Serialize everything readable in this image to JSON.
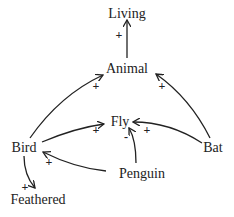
{
  "nodes": {
    "living": "Living",
    "animal": "Animal",
    "fly": "Fly",
    "bird": "Bird",
    "bat": "Bat",
    "penguin": "Penguin",
    "feathered": "Feathered"
  },
  "edges": [
    {
      "from": "Animal",
      "to": "Living",
      "sign": "+"
    },
    {
      "from": "Bird",
      "to": "Animal",
      "sign": "+"
    },
    {
      "from": "Bat",
      "to": "Animal",
      "sign": "+"
    },
    {
      "from": "Bird",
      "to": "Fly",
      "sign": "+"
    },
    {
      "from": "Bat",
      "to": "Fly",
      "sign": "+"
    },
    {
      "from": "Penguin",
      "to": "Fly",
      "sign": "-"
    },
    {
      "from": "Penguin",
      "to": "Bird",
      "sign": "+"
    },
    {
      "from": "Bird",
      "to": "Feathered",
      "sign": "+"
    }
  ],
  "signs": {
    "animal_living": "+",
    "bird_animal": "+",
    "bat_animal": "+",
    "bird_fly": "+",
    "bat_fly": "+",
    "penguin_fly": "-",
    "penguin_bird": "+",
    "bird_feathered": "+"
  }
}
